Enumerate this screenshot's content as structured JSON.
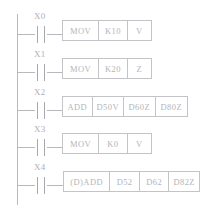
{
  "diagram": {
    "type": "plc-ladder-logic",
    "rail_color": "#b9b9bd",
    "text_color": "#b4b4ba",
    "box_border_color": "#c3c3c8",
    "rungs": [
      {
        "contact": {
          "label": "X0",
          "type": "normally-open"
        },
        "instruction": {
          "name": "MOV",
          "cells": [
            "MOV",
            "K10",
            "V"
          ]
        }
      },
      {
        "contact": {
          "label": "X1",
          "type": "normally-open"
        },
        "instruction": {
          "name": "MOV",
          "cells": [
            "MOV",
            "K20",
            "Z"
          ]
        }
      },
      {
        "contact": {
          "label": "X2",
          "type": "normally-open"
        },
        "instruction": {
          "name": "ADD",
          "cells": [
            "ADD",
            "D50V",
            "D60Z",
            "D80Z"
          ]
        }
      },
      {
        "contact": {
          "label": "X3",
          "type": "normally-open"
        },
        "instruction": {
          "name": "MOV",
          "cells": [
            "MOV",
            "K0",
            "V"
          ]
        }
      },
      {
        "contact": {
          "label": "X4",
          "type": "normally-open"
        },
        "instruction": {
          "name": "(D)ADD",
          "cells": [
            "(D)ADD",
            "D52",
            "D62",
            "D82Z"
          ]
        }
      }
    ]
  }
}
